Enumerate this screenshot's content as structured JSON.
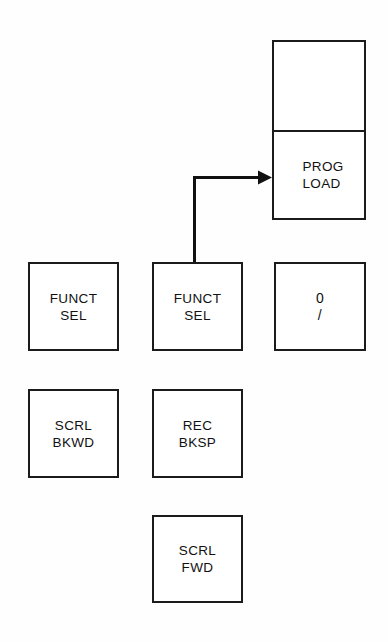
{
  "diagram": {
    "background_color": "#ffffff",
    "line_color": "#111111",
    "keys": [
      {
        "id": "blank-top",
        "name": "blank-key",
        "line1": "",
        "line2": ""
      },
      {
        "id": "prog-load",
        "name": "prog-load-key",
        "line1": "PROG",
        "line2": "LOAD"
      },
      {
        "id": "funct-sel-left",
        "name": "funct-sel-key-left",
        "line1": "FUNCT",
        "line2": "SEL"
      },
      {
        "id": "funct-sel-mid",
        "name": "funct-sel-key-middle",
        "line1": "FUNCT",
        "line2": "SEL"
      },
      {
        "id": "zero-slash",
        "name": "zero-slash-key",
        "line1": "0",
        "line2": "/"
      },
      {
        "id": "scrl-bkwd",
        "name": "scroll-backward-key",
        "line1": "SCRL",
        "line2": "BKWD"
      },
      {
        "id": "rec-bksp",
        "name": "record-backspace-key",
        "line1": "REC",
        "line2": "BKSP"
      },
      {
        "id": "scrl-fwd",
        "name": "scroll-forward-key",
        "line1": "SCRL",
        "line2": "FWD"
      }
    ],
    "connector": {
      "from": "funct-sel-key-middle",
      "to": "prog-load-key",
      "style": "elbow-arrow",
      "arrow_direction": "right"
    }
  }
}
